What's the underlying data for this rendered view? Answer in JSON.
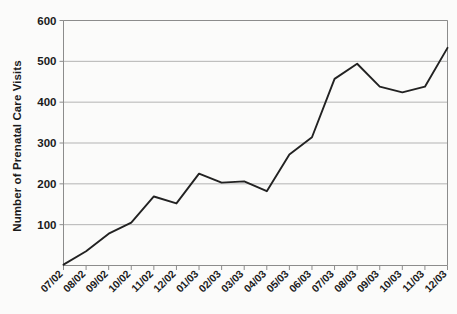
{
  "chart_data": {
    "type": "line",
    "title": "",
    "xlabel": "",
    "ylabel": "Number of Prenatal Care Visits",
    "categories": [
      "07/02",
      "08/02",
      "09/02",
      "10/02",
      "11/02",
      "12/02",
      "01/03",
      "02/03",
      "03/03",
      "04/03",
      "05/03",
      "06/03",
      "07/03",
      "08/03",
      "09/03",
      "10/03",
      "11/03",
      "12/03"
    ],
    "values": [
      2,
      35,
      78,
      105,
      169,
      152,
      225,
      203,
      206,
      182,
      272,
      314,
      457,
      494,
      438,
      424,
      438,
      533
    ],
    "series": [
      {
        "name": "Prenatal Care Visits",
        "values": [
          2,
          35,
          78,
          105,
          169,
          152,
          225,
          203,
          206,
          182,
          272,
          314,
          457,
          494,
          438,
          424,
          438,
          533
        ]
      }
    ],
    "ylim": [
      0,
      600
    ],
    "yticks": [
      100,
      200,
      300,
      400,
      500,
      600
    ],
    "ytick_labels": [
      "100",
      "200",
      "300",
      "400",
      "500",
      "600"
    ],
    "grid": "horizontal",
    "legend": "none",
    "line_color": "#222222",
    "grid_color": "#b3b3b3",
    "axis_color": "#8c8c8c",
    "background_color": "#fbfbfa"
  },
  "axis": {
    "y_title": "Number of Prenatal Care Visits"
  }
}
